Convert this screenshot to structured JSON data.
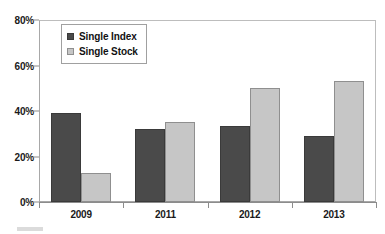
{
  "chart_data": {
    "type": "bar",
    "title": "",
    "subtitle": "",
    "xlabel": "",
    "ylabel": "",
    "categories": [
      "2009",
      "2011",
      "2012",
      "2013"
    ],
    "series": [
      {
        "name": "Single Index",
        "color": "#4a4a4a",
        "values": [
          39,
          32,
          33.5,
          29
        ]
      },
      {
        "name": "Single Stock",
        "color": "#c6c6c6",
        "values": [
          12.7,
          35,
          50,
          53
        ]
      }
    ],
    "ylim": [
      0,
      80
    ],
    "ytick_values": [
      0,
      20,
      40,
      60,
      80
    ],
    "ytick_labels": [
      "0%",
      "20%",
      "40%",
      "60%",
      "80%"
    ],
    "grid": false,
    "legend_position": "upper-left",
    "value_suffix": "%",
    "axis_color": "#8c8c8c",
    "frame_color": "#a8a8a8",
    "background": "#ffffff"
  }
}
